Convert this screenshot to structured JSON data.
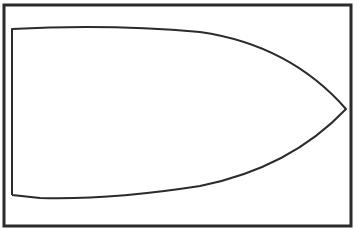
{
  "figure": {
    "width": 357,
    "height": 229,
    "background_color": "#ffffff",
    "stroke_color": "#2b2b2b",
    "frame": {
      "x": 4,
      "y": 5,
      "width": 347,
      "height": 221,
      "stroke_width": 3
    },
    "shape": {
      "name": "bow-outline",
      "stroke_width": 2,
      "path": "M 12 195 L 12 29 Q 110 24 200 32 Q 290 45 346 109 Q 290 168 200 186 Q 110 200 40 198 L 12 195"
    }
  }
}
